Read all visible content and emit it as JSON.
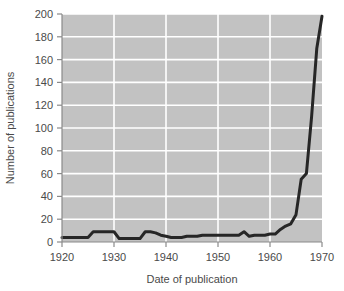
{
  "chart_data": {
    "type": "line",
    "title": "",
    "xlabel": "Date of publication",
    "ylabel": "Number of publications",
    "xlim": [
      1920,
      1970
    ],
    "ylim": [
      0,
      200
    ],
    "xticks": [
      1920,
      1930,
      1940,
      1950,
      1960,
      1970
    ],
    "yticks": [
      0,
      20,
      40,
      60,
      80,
      100,
      120,
      140,
      160,
      180,
      200
    ],
    "xtick_labels": [
      "1920",
      "1930",
      "1940",
      "1950",
      "1960",
      "1970"
    ],
    "ytick_labels": [
      "0",
      "20",
      "40",
      "60",
      "80",
      "100",
      "120",
      "140",
      "160",
      "180",
      "200"
    ],
    "grid": true,
    "legend": false,
    "plot_background_color": "#c2c2c2",
    "gridline_color": "#ffffff",
    "line_color": "#262626",
    "line_width": 3,
    "x": [
      1920,
      1921,
      1922,
      1923,
      1924,
      1925,
      1926,
      1927,
      1928,
      1929,
      1930,
      1931,
      1932,
      1933,
      1934,
      1935,
      1936,
      1937,
      1938,
      1939,
      1940,
      1941,
      1942,
      1943,
      1944,
      1945,
      1946,
      1947,
      1948,
      1949,
      1950,
      1951,
      1952,
      1953,
      1954,
      1955,
      1956,
      1957,
      1958,
      1959,
      1960,
      1961,
      1962,
      1963,
      1964,
      1965,
      1966,
      1967,
      1968,
      1969,
      1970
    ],
    "values": [
      4,
      4,
      4,
      4,
      4,
      4,
      9,
      9,
      9,
      9,
      9,
      3,
      3,
      3,
      3,
      3,
      9,
      9,
      8,
      6,
      5,
      4,
      4,
      4,
      5,
      5,
      5,
      6,
      6,
      6,
      6,
      6,
      6,
      6,
      6,
      9,
      5,
      6,
      6,
      6,
      7,
      7,
      11,
      14,
      16,
      24,
      55,
      60,
      110,
      170,
      198
    ],
    "series_name": "Number of publications"
  },
  "axis": {
    "ylabel": "Number of publications",
    "xlabel": "Date of publication"
  }
}
